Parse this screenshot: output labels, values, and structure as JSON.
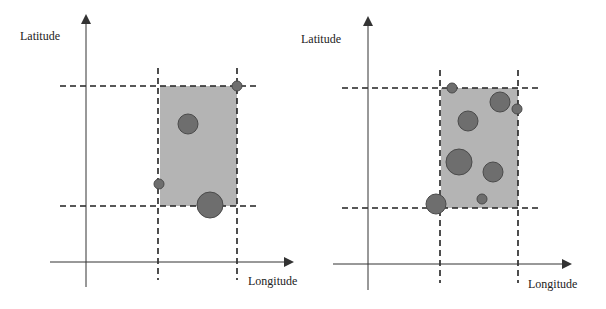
{
  "panels": [
    {
      "id": "left",
      "y_axis_label": "Latitude",
      "x_axis_label": "Longitude",
      "axis": {
        "origin_x": 86,
        "origin_y": 262,
        "y_top": 16,
        "y_bottom": 287,
        "x_left": 50,
        "x_right": 292
      },
      "label_pos": {
        "lat_x": 20,
        "lat_y": 40,
        "lon_x": 248,
        "lon_y": 285
      },
      "dashed_verticals": [
        {
          "x": 158,
          "y1": 68,
          "y2": 280
        },
        {
          "x": 237,
          "y1": 68,
          "y2": 280
        }
      ],
      "dashed_horizontals": [
        {
          "y": 86,
          "x1": 60,
          "x2": 258
        },
        {
          "y": 206,
          "x1": 60,
          "x2": 258
        }
      ],
      "region": {
        "x": 160,
        "y": 86,
        "width": 77,
        "height": 120
      },
      "points": [
        {
          "cx": 237,
          "cy": 86,
          "r": 5
        },
        {
          "cx": 188,
          "cy": 124,
          "r": 10
        },
        {
          "cx": 159,
          "cy": 184,
          "r": 5
        },
        {
          "cx": 210,
          "cy": 205,
          "r": 13
        }
      ]
    },
    {
      "id": "right",
      "y_axis_label": "Latitude",
      "x_axis_label": "Longitude",
      "axis": {
        "origin_x": 368,
        "origin_y": 264,
        "y_top": 18,
        "y_bottom": 290,
        "x_left": 333,
        "x_right": 570
      },
      "label_pos": {
        "lat_x": 301,
        "lat_y": 43,
        "lon_x": 528,
        "lon_y": 288
      },
      "dashed_verticals": [
        {
          "x": 440,
          "y1": 70,
          "y2": 283
        },
        {
          "x": 518,
          "y1": 70,
          "y2": 283
        }
      ],
      "dashed_horizontals": [
        {
          "y": 88,
          "x1": 342,
          "x2": 540
        },
        {
          "y": 208,
          "x1": 342,
          "x2": 540
        }
      ],
      "region": {
        "x": 441,
        "y": 88,
        "width": 77,
        "height": 120
      },
      "points": [
        {
          "cx": 452,
          "cy": 88,
          "r": 5
        },
        {
          "cx": 500,
          "cy": 102,
          "r": 10
        },
        {
          "cx": 517,
          "cy": 109,
          "r": 5
        },
        {
          "cx": 468,
          "cy": 121,
          "r": 10
        },
        {
          "cx": 459,
          "cy": 162,
          "r": 13
        },
        {
          "cx": 493,
          "cy": 172,
          "r": 10
        },
        {
          "cx": 482,
          "cy": 199,
          "r": 5
        },
        {
          "cx": 436,
          "cy": 204,
          "r": 10
        }
      ]
    }
  ],
  "colors": {
    "axis": "#333333",
    "dash": "#222222",
    "region_fill": "#b4b4b4",
    "point_fill": "#6e6e6e",
    "point_stroke": "#4a4a4a"
  }
}
